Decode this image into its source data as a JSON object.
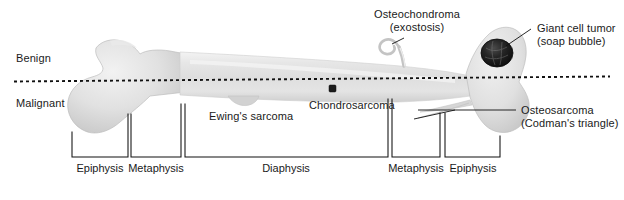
{
  "figure": {
    "classification": {
      "benign_label": "Benign",
      "malignant_label": "Malignant",
      "divider_style": "dotted"
    },
    "annotations": [
      {
        "id": "osteochondroma",
        "line1": "Osteochondroma",
        "line2": "(exostosis)",
        "zone": "benign"
      },
      {
        "id": "giant-cell-tumor",
        "line1": "Giant cell tumor",
        "line2": "(soap bubble)",
        "zone": "benign"
      },
      {
        "id": "ewings-sarcoma",
        "line1": "Ewing's sarcoma",
        "line2": "",
        "zone": "malignant"
      },
      {
        "id": "chondrosarcoma",
        "line1": "Chondrosarcoma",
        "line2": "",
        "zone": "malignant"
      },
      {
        "id": "osteosarcoma",
        "line1": "Osteosarcoma",
        "line2": "(Codman's triangle)",
        "zone": "malignant"
      }
    ],
    "regions": [
      {
        "id": "epiphysis-proximal",
        "label": "Epiphysis"
      },
      {
        "id": "metaphysis-proximal",
        "label": "Metaphysis"
      },
      {
        "id": "diaphysis",
        "label": "Diaphysis"
      },
      {
        "id": "metaphysis-distal",
        "label": "Metaphysis"
      },
      {
        "id": "epiphysis-distal",
        "label": "Epiphysis"
      }
    ],
    "colors": {
      "bone_light": "#ededed",
      "bone_mid": "#dcdcdc",
      "bone_shadow": "#c9c9c9",
      "tumor_dark": "#1e1e1e",
      "text": "#1a1a1a",
      "line": "#111111",
      "background": "#ffffff"
    }
  }
}
